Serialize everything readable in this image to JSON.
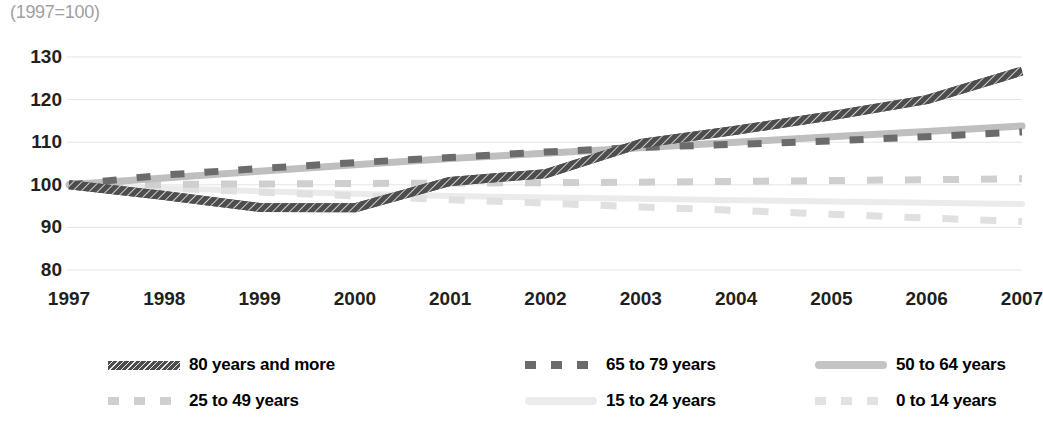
{
  "axis_note": "(1997=100)",
  "chart_data": {
    "type": "line",
    "title": "",
    "subtitle": "(1997=100)",
    "xlabel": "",
    "ylabel": "",
    "grid": true,
    "legend_position": "bottom",
    "x": [
      1997,
      1998,
      1999,
      2000,
      2001,
      2002,
      2003,
      2004,
      2005,
      2006,
      2007
    ],
    "categories": [
      "1997",
      "1998",
      "1999",
      "2000",
      "2001",
      "2002",
      "2003",
      "2004",
      "2005",
      "2006",
      "2007"
    ],
    "xtick_labels": [
      "1997",
      "1998",
      "1999",
      "2000",
      "2001",
      "2002",
      "2003",
      "2004",
      "2005",
      "2006",
      "2007"
    ],
    "ytick_labels": [
      "80",
      "90",
      "100",
      "110",
      "120",
      "130"
    ],
    "yticks": [
      80,
      90,
      100,
      110,
      120,
      130
    ],
    "ylim": [
      80,
      130
    ],
    "xlim": [
      1997,
      2007
    ],
    "series": [
      {
        "name": "80 years and more",
        "color": "#4d4d4d",
        "style": "hatched-solid",
        "values": [
          100.0,
          97.5,
          94.7,
          94.6,
          100.8,
          102.6,
          109.7,
          112.8,
          116.2,
          120.0,
          126.7
        ]
      },
      {
        "name": "65 to 79 years",
        "color": "#6b6b6b",
        "style": "dashed",
        "values": [
          100.0,
          102.3,
          103.8,
          105.2,
          106.4,
          107.7,
          108.8,
          109.5,
          110.3,
          111.3,
          112.4
        ]
      },
      {
        "name": "50 to 64 years",
        "color": "#bfbfbf",
        "style": "solid",
        "values": [
          100.0,
          101.6,
          103.2,
          104.7,
          106.2,
          107.4,
          108.7,
          110.0,
          111.3,
          112.5,
          113.8
        ]
      },
      {
        "name": "25 to 49 years",
        "color": "#cfcfcf",
        "style": "dashed",
        "values": [
          100.0,
          100.1,
          100.2,
          100.3,
          100.4,
          100.5,
          100.6,
          100.8,
          101.0,
          101.2,
          101.4
        ]
      },
      {
        "name": "15 to 24 years",
        "color": "#ebebeb",
        "style": "solid",
        "values": [
          100.0,
          99.2,
          98.5,
          97.9,
          97.4,
          97.0,
          96.7,
          96.4,
          96.1,
          95.8,
          95.5
        ]
      },
      {
        "name": "0 to 14 years",
        "color": "#e0e0e0",
        "style": "dashed",
        "values": [
          100.0,
          99.2,
          98.3,
          97.4,
          96.5,
          95.7,
          94.8,
          94.0,
          93.1,
          92.2,
          91.4
        ]
      }
    ]
  },
  "legend": {
    "items": [
      {
        "label": "80 years and more",
        "color": "#4d4d4d",
        "style": "hatched-solid"
      },
      {
        "label": "65 to 79 years",
        "color": "#6b6b6b",
        "style": "dashed"
      },
      {
        "label": "50 to 64 years",
        "color": "#c4c4c4",
        "style": "solid"
      },
      {
        "label": "25 to 49 years",
        "color": "#cfcfcf",
        "style": "dashed"
      },
      {
        "label": "15 to 24 years",
        "color": "#ececec",
        "style": "solid"
      },
      {
        "label": "0 to 14 years",
        "color": "#e2e2e2",
        "style": "dashed"
      }
    ]
  }
}
